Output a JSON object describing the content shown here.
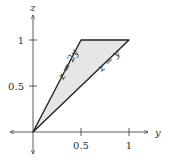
{
  "diagram": {
    "axes": {
      "x_label": "y",
      "y_label": "z",
      "x_ticks": [
        "0.5",
        "1"
      ],
      "y_ticks": [
        "0.5",
        "1"
      ]
    },
    "region": {
      "fill": "#e6e6e6",
      "stroke": "#222222",
      "vertices": [
        [
          0,
          0
        ],
        [
          0.5,
          1
        ],
        [
          1,
          1
        ]
      ]
    },
    "lines": [
      {
        "label": "z = 2y"
      },
      {
        "label": "z = y"
      }
    ]
  }
}
